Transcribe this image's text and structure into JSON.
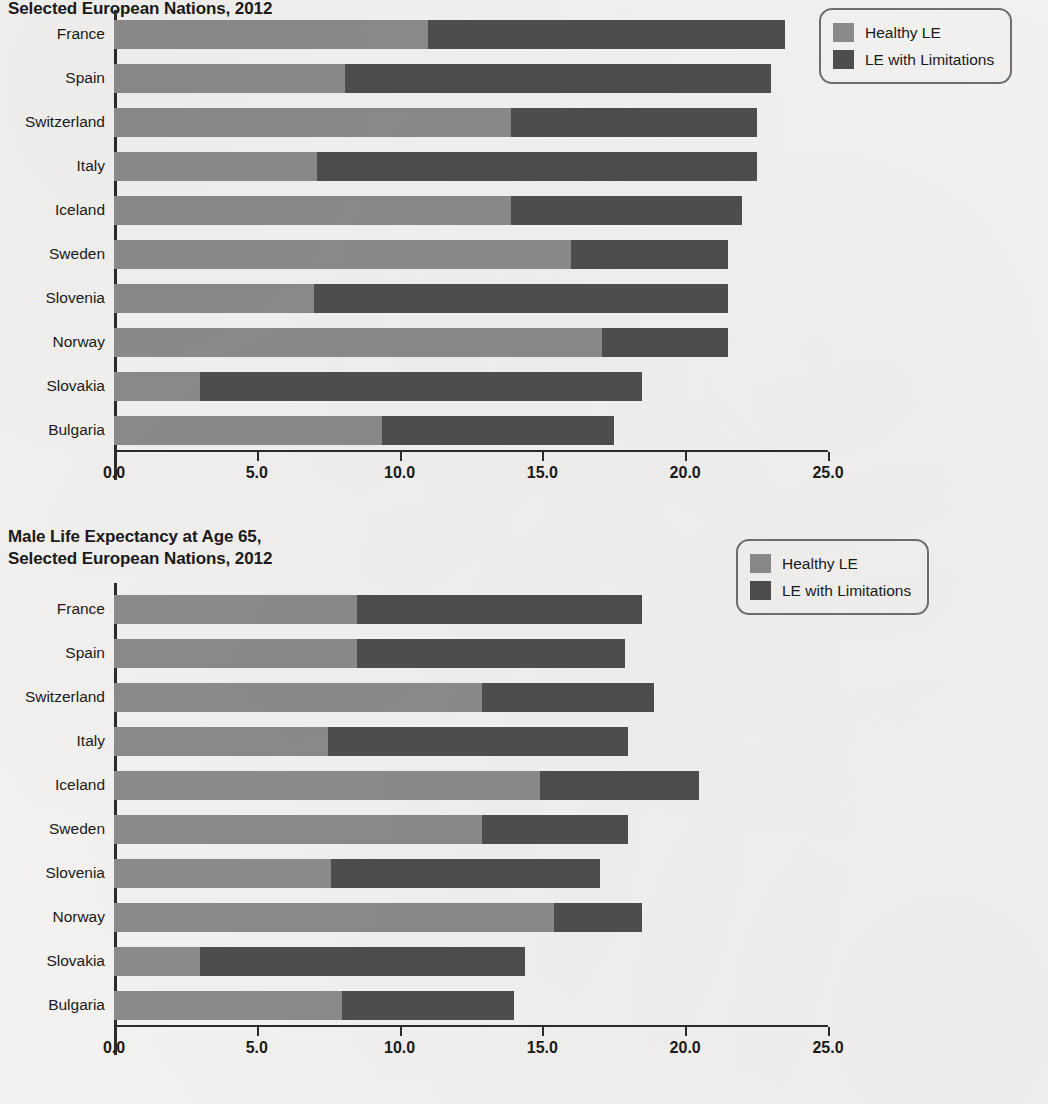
{
  "colors": {
    "healthy": "#8b8b8b",
    "limited": "#4e4e4e",
    "axis": "#2b2b2b",
    "page_background": "#f3f2f0"
  },
  "female_chart": {
    "title": "Female Life Expectancy at Age 65,\nSelected European Nations, 2012",
    "legend": {
      "healthy_label": "Healthy LE",
      "limited_label": "LE with Limitations"
    },
    "axis": {
      "ticks": [
        "0.0",
        "5.0",
        "10.0",
        "15.0",
        "20.0",
        "25.0"
      ]
    }
  },
  "male_chart": {
    "title": "Male Life Expectancy at Age 65,\nSelected European Nations, 2012",
    "legend": {
      "healthy_label": "Healthy LE",
      "limited_label": "LE with Limitations"
    },
    "axis": {
      "ticks": [
        "0.0",
        "5.0",
        "10.0",
        "15.0",
        "20.0",
        "25.0"
      ]
    }
  },
  "chart_data": [
    {
      "type": "bar",
      "orientation": "horizontal",
      "stacked": true,
      "title": "Female Life Expectancy at Age 65, Selected European Nations, 2012",
      "xlabel": "",
      "ylabel": "",
      "xlim": [
        0.0,
        25.0
      ],
      "xticks": [
        0.0,
        5.0,
        10.0,
        15.0,
        20.0,
        25.0
      ],
      "grid": false,
      "legend_position": "top-right",
      "categories": [
        "France",
        "Spain",
        "Switzerland",
        "Italy",
        "Iceland",
        "Sweden",
        "Slovenia",
        "Norway",
        "Slovakia",
        "Bulgaria"
      ],
      "series": [
        {
          "name": "Healthy LE",
          "color": "#8b8b8b",
          "values": [
            11.0,
            8.1,
            13.9,
            7.1,
            13.9,
            16.0,
            7.0,
            17.1,
            3.0,
            9.4
          ]
        },
        {
          "name": "LE with Limitations",
          "color": "#4e4e4e",
          "values": [
            12.5,
            14.9,
            8.6,
            15.4,
            8.1,
            5.5,
            14.5,
            4.4,
            15.5,
            8.1
          ]
        }
      ],
      "totals": [
        23.5,
        23.0,
        22.5,
        22.5,
        22.0,
        21.5,
        21.5,
        21.5,
        18.5,
        17.5
      ]
    },
    {
      "type": "bar",
      "orientation": "horizontal",
      "stacked": true,
      "title": "Male Life Expectancy at Age 65, Selected European Nations, 2012",
      "xlabel": "",
      "ylabel": "",
      "xlim": [
        0.0,
        25.0
      ],
      "xticks": [
        0.0,
        5.0,
        10.0,
        15.0,
        20.0,
        25.0
      ],
      "grid": false,
      "legend_position": "top-right",
      "categories": [
        "France",
        "Spain",
        "Switzerland",
        "Italy",
        "Iceland",
        "Sweden",
        "Slovenia",
        "Norway",
        "Slovakia",
        "Bulgaria"
      ],
      "series": [
        {
          "name": "Healthy LE",
          "color": "#8b8b8b",
          "values": [
            8.5,
            8.5,
            12.9,
            7.5,
            14.9,
            12.9,
            7.6,
            15.4,
            3.0,
            8.0
          ]
        },
        {
          "name": "LE with Limitations",
          "color": "#4e4e4e",
          "values": [
            10.0,
            9.4,
            6.0,
            10.5,
            5.6,
            5.1,
            9.4,
            3.1,
            11.4,
            6.0
          ]
        }
      ],
      "totals": [
        18.5,
        17.9,
        18.9,
        18.0,
        20.5,
        18.0,
        17.0,
        18.5,
        14.4,
        14.0
      ]
    }
  ]
}
